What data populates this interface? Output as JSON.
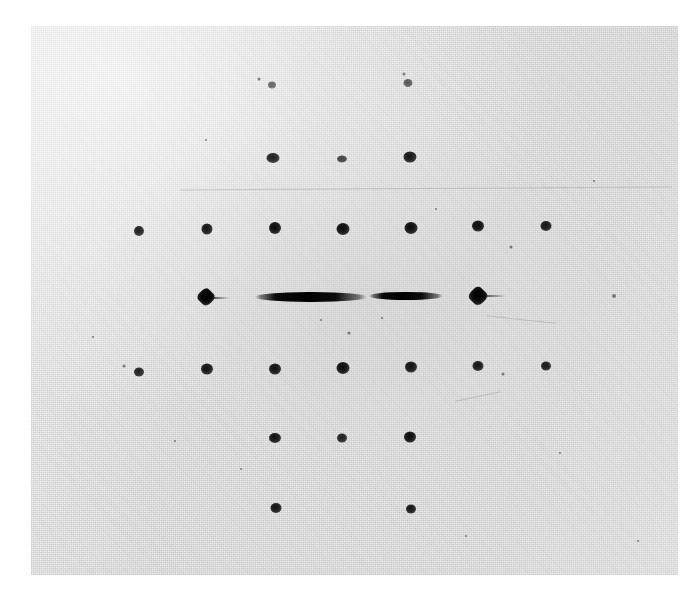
{
  "figure": {
    "kind": "diffraction-photograph",
    "canvas": {
      "width": 698,
      "height": 599
    },
    "page_background": "#ffffff"
  },
  "plate": {
    "name": "photographic-plate",
    "left": 31,
    "top": 26,
    "width": 647,
    "height": 549,
    "background_color": "#ededec",
    "emulsion_tone": "#e4e4e3",
    "grain": "halftone-dot"
  },
  "chart_data": {
    "type": "scatter",
    "xlabel": "",
    "ylabel": "",
    "grid": false,
    "legend": null,
    "xlim": [
      31,
      678
    ],
    "ylim": [
      26,
      575
    ],
    "lattice": {
      "column_spacing_px": 68,
      "row_spacing_px": 69,
      "center_x": 342,
      "center_y": 297
    },
    "spots": [
      {
        "id": "r0c-1",
        "shape": "round",
        "x": 272,
        "y": 85,
        "w": 8,
        "h": 7,
        "intensity": 0.55
      },
      {
        "id": "r0c1",
        "shape": "round",
        "x": 408,
        "y": 83,
        "w": 9,
        "h": 8,
        "intensity": 0.6
      },
      {
        "id": "r1c-1",
        "shape": "round",
        "x": 273,
        "y": 158,
        "w": 13,
        "h": 10,
        "intensity": 0.85
      },
      {
        "id": "r1c0",
        "shape": "round",
        "x": 342,
        "y": 159,
        "w": 10,
        "h": 7,
        "intensity": 0.7
      },
      {
        "id": "r1c1",
        "shape": "round",
        "x": 410,
        "y": 157,
        "w": 13,
        "h": 11,
        "intensity": 0.9
      },
      {
        "id": "r2c-3",
        "shape": "round",
        "x": 139,
        "y": 231,
        "w": 10,
        "h": 10,
        "intensity": 0.85
      },
      {
        "id": "r2c-2",
        "shape": "round",
        "x": 207,
        "y": 229,
        "w": 11,
        "h": 11,
        "intensity": 0.9
      },
      {
        "id": "r2c-1",
        "shape": "round",
        "x": 275,
        "y": 228,
        "w": 12,
        "h": 12,
        "intensity": 0.95
      },
      {
        "id": "r2c0",
        "shape": "round",
        "x": 343,
        "y": 229,
        "w": 13,
        "h": 12,
        "intensity": 0.95
      },
      {
        "id": "r2c1",
        "shape": "round",
        "x": 411,
        "y": 228,
        "w": 13,
        "h": 12,
        "intensity": 0.95
      },
      {
        "id": "r2c2",
        "shape": "round",
        "x": 478,
        "y": 226,
        "w": 12,
        "h": 11,
        "intensity": 0.95
      },
      {
        "id": "r2c3",
        "shape": "round",
        "x": 546,
        "y": 226,
        "w": 11,
        "h": 10,
        "intensity": 0.9
      },
      {
        "id": "r3c-2",
        "shape": "diamond",
        "x": 206,
        "y": 297,
        "w": 15,
        "h": 15,
        "intensity": 1.0
      },
      {
        "id": "r3c-1",
        "shape": "streak",
        "x": 311,
        "y": 297,
        "w": 112,
        "h": 10,
        "intensity": 1.0
      },
      {
        "id": "r3c1",
        "shape": "streak",
        "x": 406,
        "y": 296,
        "w": 74,
        "h": 8,
        "intensity": 1.0
      },
      {
        "id": "r3c2",
        "shape": "diamond",
        "x": 478,
        "y": 296,
        "w": 16,
        "h": 16,
        "intensity": 1.0
      },
      {
        "id": "r4c-3",
        "shape": "round",
        "x": 139,
        "y": 372,
        "w": 10,
        "h": 9,
        "intensity": 0.85
      },
      {
        "id": "r4c-2",
        "shape": "round",
        "x": 207,
        "y": 369,
        "w": 12,
        "h": 11,
        "intensity": 0.92
      },
      {
        "id": "r4c-1",
        "shape": "round",
        "x": 275,
        "y": 369,
        "w": 12,
        "h": 11,
        "intensity": 0.92
      },
      {
        "id": "r4c0",
        "shape": "round",
        "x": 343,
        "y": 368,
        "w": 13,
        "h": 12,
        "intensity": 0.95
      },
      {
        "id": "r4c1",
        "shape": "round",
        "x": 411,
        "y": 367,
        "w": 12,
        "h": 11,
        "intensity": 0.92
      },
      {
        "id": "r4c2",
        "shape": "round",
        "x": 478,
        "y": 366,
        "w": 11,
        "h": 10,
        "intensity": 0.9
      },
      {
        "id": "r4c3",
        "shape": "round",
        "x": 546,
        "y": 366,
        "w": 10,
        "h": 9,
        "intensity": 0.88
      },
      {
        "id": "r5c-1",
        "shape": "round",
        "x": 275,
        "y": 438,
        "w": 12,
        "h": 10,
        "intensity": 0.92
      },
      {
        "id": "r5c0",
        "shape": "round",
        "x": 342,
        "y": 438,
        "w": 10,
        "h": 9,
        "intensity": 0.85
      },
      {
        "id": "r5c1",
        "shape": "round",
        "x": 410,
        "y": 437,
        "w": 12,
        "h": 11,
        "intensity": 0.95
      },
      {
        "id": "r6c-1",
        "shape": "round",
        "x": 276,
        "y": 508,
        "w": 11,
        "h": 10,
        "intensity": 0.92
      },
      {
        "id": "r6c1",
        "shape": "round",
        "x": 411,
        "y": 509,
        "w": 10,
        "h": 9,
        "intensity": 0.9
      }
    ],
    "tails": [
      {
        "id": "tail-left-diamond",
        "x": 212,
        "y": 298,
        "w": 18,
        "h": 2
      },
      {
        "id": "tail-right-diamond",
        "x": 484,
        "y": 296,
        "w": 22,
        "h": 2
      }
    ],
    "specks": [
      {
        "x": 124,
        "y": 366,
        "d": 3
      },
      {
        "x": 259,
        "y": 79,
        "d": 3
      },
      {
        "x": 404,
        "y": 74,
        "d": 3
      },
      {
        "x": 511,
        "y": 247,
        "d": 3
      },
      {
        "x": 614,
        "y": 296,
        "d": 4
      },
      {
        "x": 503,
        "y": 374,
        "d": 3
      },
      {
        "x": 349,
        "y": 333,
        "d": 3
      },
      {
        "x": 321,
        "y": 320,
        "d": 2
      },
      {
        "x": 382,
        "y": 318,
        "d": 2
      },
      {
        "x": 436,
        "y": 209,
        "d": 2
      },
      {
        "x": 175,
        "y": 441,
        "d": 2
      },
      {
        "x": 93,
        "y": 337,
        "d": 2
      },
      {
        "x": 594,
        "y": 181,
        "d": 2
      },
      {
        "x": 241,
        "y": 469,
        "d": 2
      },
      {
        "x": 466,
        "y": 536,
        "d": 2
      },
      {
        "x": 560,
        "y": 453,
        "d": 2
      },
      {
        "x": 638,
        "y": 541,
        "d": 2
      },
      {
        "x": 206,
        "y": 140,
        "d": 2
      }
    ],
    "scratches": [
      {
        "id": "scratch-upper",
        "x": 180,
        "y": 188,
        "w": 492,
        "h": 1,
        "rotate": -0.35
      },
      {
        "id": "scratch-mid",
        "x": 486,
        "y": 319,
        "w": 70,
        "h": 1,
        "rotate": 6
      },
      {
        "id": "scratch-lower",
        "x": 455,
        "y": 396,
        "w": 46,
        "h": 1,
        "rotate": -12
      }
    ]
  }
}
